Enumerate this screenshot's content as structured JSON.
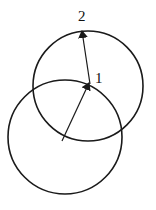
{
  "diagram": {
    "labels": {
      "point1": "1",
      "point2": "2"
    },
    "stroke_color": "#1a1a1a",
    "background": "#ffffff",
    "circles": [
      {
        "name": "lower-circle",
        "cx": 65,
        "cy": 137,
        "r": 57
      },
      {
        "name": "upper-circle",
        "cx": 88,
        "cy": 86,
        "r": 55
      }
    ],
    "arrows": [
      {
        "name": "arrow-to-point-1",
        "from": [
          62,
          141
        ],
        "to": [
          89,
          83
        ]
      },
      {
        "name": "arrow-to-point-2",
        "from": [
          90,
          84
        ],
        "to": [
          82,
          31
        ]
      }
    ]
  }
}
